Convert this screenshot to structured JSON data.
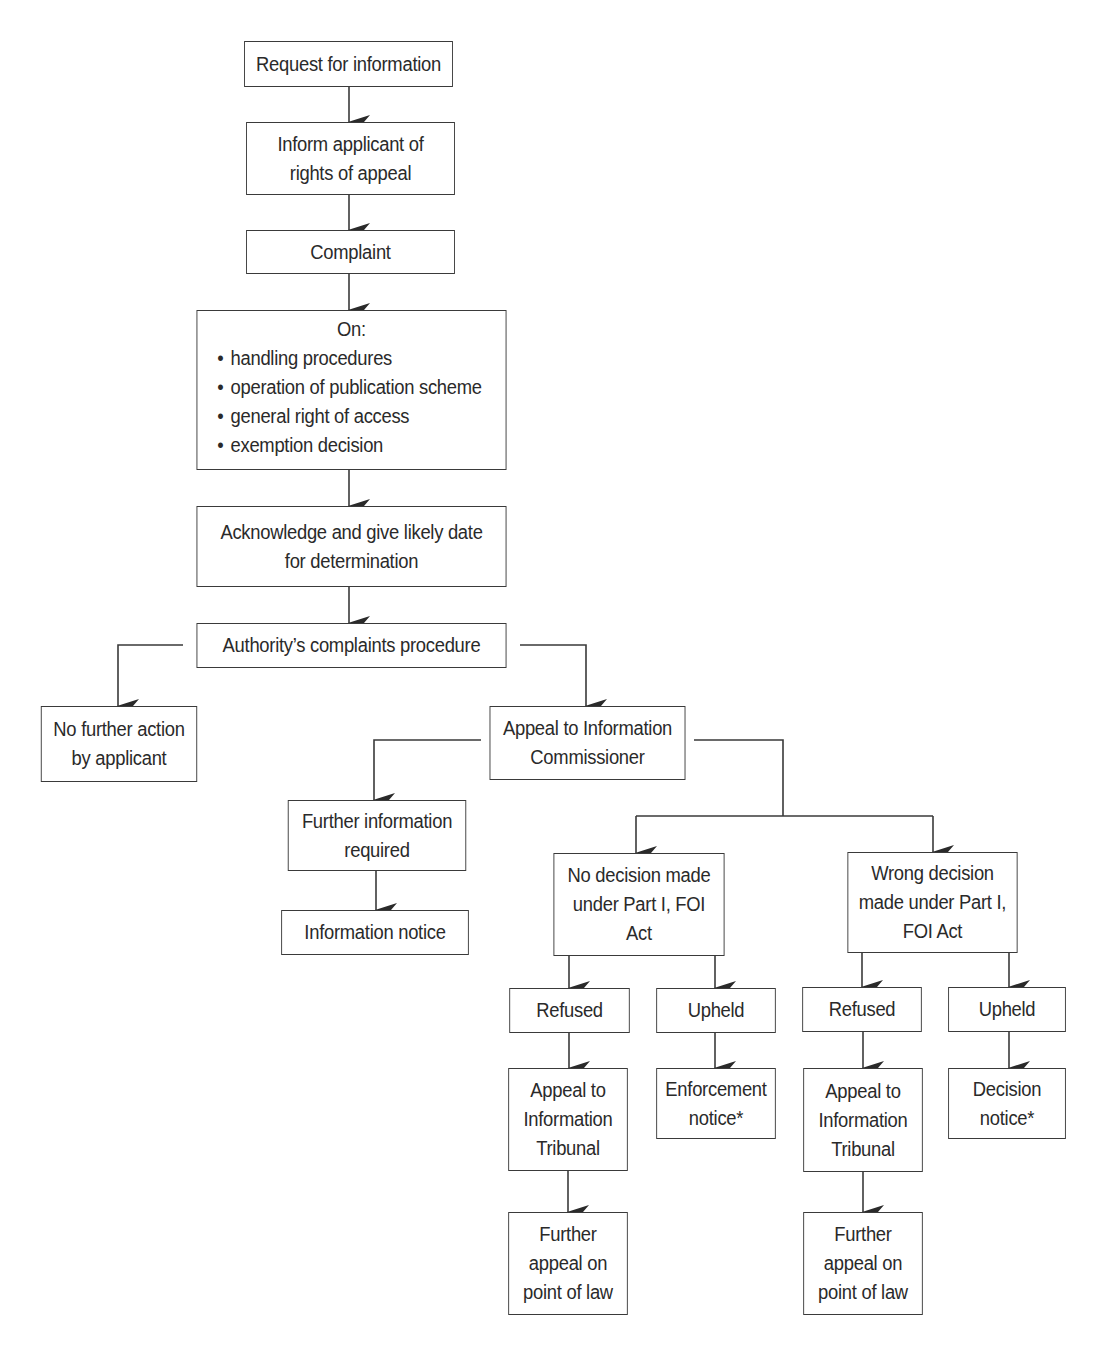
{
  "diagram": {
    "type": "flowchart",
    "colors": {
      "stroke": "#3a3a3a",
      "text": "#2a2a2a",
      "background": "#ffffff"
    },
    "nodes": {
      "request": {
        "lines": [
          "Request for information"
        ]
      },
      "inform": {
        "lines": [
          "Inform applicant of",
          "rights of appeal"
        ]
      },
      "complaint": {
        "lines": [
          "Complaint"
        ]
      },
      "on": {
        "head": "On:",
        "bullets": [
          "handling procedures",
          "operation of publication scheme",
          "general right of access",
          "exemption decision"
        ]
      },
      "acknowledge": {
        "lines": [
          "Acknowledge and give likely date",
          "for determination"
        ]
      },
      "authority": {
        "lines": [
          "Authority’s complaints procedure"
        ]
      },
      "no_further_action": {
        "lines": [
          "No further action",
          "by applicant"
        ]
      },
      "appeal_ic": {
        "lines": [
          "Appeal to Information",
          "Commissioner"
        ]
      },
      "further_info": {
        "lines": [
          "Further information",
          "required"
        ]
      },
      "info_notice": {
        "lines": [
          "Information notice"
        ]
      },
      "no_decision": {
        "lines": [
          "No decision made",
          "under Part I, FOI",
          "Act"
        ]
      },
      "wrong_decision": {
        "lines": [
          "Wrong decision",
          "made under Part I,",
          "FOI Act"
        ]
      },
      "refused_left": {
        "lines": [
          "Refused"
        ]
      },
      "upheld_left": {
        "lines": [
          "Upheld"
        ]
      },
      "refused_right": {
        "lines": [
          "Refused"
        ]
      },
      "upheld_right": {
        "lines": [
          "Upheld"
        ]
      },
      "tribunal_left": {
        "lines": [
          "Appeal to",
          "Information",
          "Tribunal"
        ]
      },
      "enforcement": {
        "lines": [
          "Enforcement",
          "notice*"
        ]
      },
      "tribunal_right": {
        "lines": [
          "Appeal to",
          "Information",
          "Tribunal"
        ]
      },
      "decision_notice": {
        "lines": [
          "Decision",
          "notice*"
        ]
      },
      "further_appeal_left": {
        "lines": [
          "Further",
          "appeal on",
          "point of law"
        ]
      },
      "further_appeal_right": {
        "lines": [
          "Further",
          "appeal on",
          "point of law"
        ]
      }
    },
    "edges": [
      [
        "request",
        "inform"
      ],
      [
        "inform",
        "complaint"
      ],
      [
        "complaint",
        "on"
      ],
      [
        "on",
        "acknowledge"
      ],
      [
        "acknowledge",
        "authority"
      ],
      [
        "authority",
        "no_further_action"
      ],
      [
        "authority",
        "appeal_ic"
      ],
      [
        "appeal_ic",
        "further_info"
      ],
      [
        "appeal_ic",
        "no_decision"
      ],
      [
        "appeal_ic",
        "wrong_decision"
      ],
      [
        "further_info",
        "info_notice"
      ],
      [
        "no_decision",
        "refused_left"
      ],
      [
        "no_decision",
        "upheld_left"
      ],
      [
        "wrong_decision",
        "refused_right"
      ],
      [
        "wrong_decision",
        "upheld_right"
      ],
      [
        "refused_left",
        "tribunal_left"
      ],
      [
        "upheld_left",
        "enforcement"
      ],
      [
        "refused_right",
        "tribunal_right"
      ],
      [
        "upheld_right",
        "decision_notice"
      ],
      [
        "tribunal_left",
        "further_appeal_left"
      ],
      [
        "tribunal_right",
        "further_appeal_right"
      ]
    ]
  }
}
